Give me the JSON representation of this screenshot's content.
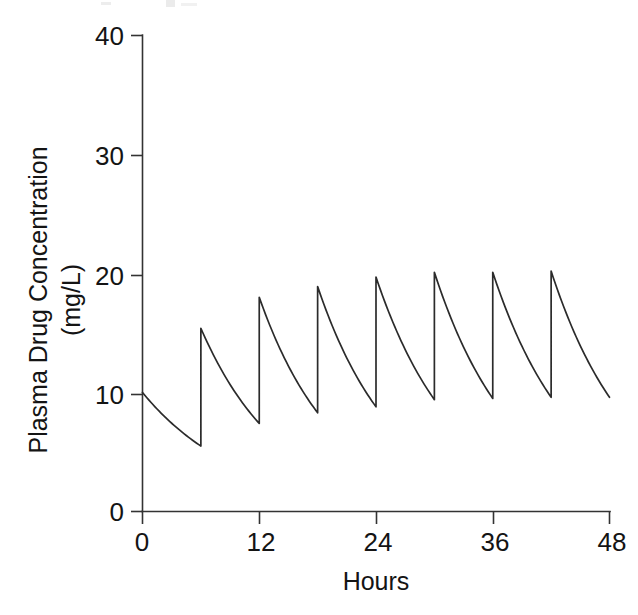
{
  "chart_data": {
    "type": "line",
    "title": "",
    "subtitle": "",
    "xlabel": "Hours",
    "ylabel": "Plasma Drug Concentration (mg/L)",
    "ylabel_line1": "Plasma Drug Concentration",
    "ylabel_line2": "(mg/L)",
    "xlim": [
      0,
      48
    ],
    "ylim": [
      0,
      40
    ],
    "xticks": [
      0,
      12,
      24,
      36,
      48
    ],
    "xtick_labels": [
      "0",
      "12",
      "24",
      "36",
      "48"
    ],
    "yticks": [
      0,
      10,
      20,
      30,
      40
    ],
    "ytick_labels": [
      "0",
      "10",
      "20",
      "30",
      "40"
    ],
    "grid": false,
    "legend": null,
    "legend_position": "none",
    "annotations": [],
    "dosing_interval_hours": 6,
    "number_of_doses": 8,
    "series": [
      {
        "name": "Plasma drug concentration",
        "color": "#2b2b2b",
        "x": [
          0,
          6,
          6,
          12,
          12,
          18,
          18,
          24,
          24,
          30,
          30,
          36,
          36,
          42,
          42,
          48
        ],
        "y": [
          10.0,
          5.5,
          15.4,
          7.4,
          18.0,
          8.3,
          18.9,
          8.8,
          19.7,
          9.4,
          20.1,
          9.5,
          20.1,
          9.6,
          20.2,
          9.6
        ],
        "peaks": [
          {
            "hour": 0,
            "value": 10.0
          },
          {
            "hour": 6,
            "value": 15.4
          },
          {
            "hour": 12,
            "value": 18.0
          },
          {
            "hour": 18,
            "value": 18.9
          },
          {
            "hour": 24,
            "value": 19.7
          },
          {
            "hour": 30,
            "value": 20.1
          },
          {
            "hour": 36,
            "value": 20.1
          },
          {
            "hour": 42,
            "value": 20.2
          }
        ],
        "troughs": [
          {
            "hour": 6,
            "value": 5.5
          },
          {
            "hour": 12,
            "value": 7.4
          },
          {
            "hour": 18,
            "value": 8.3
          },
          {
            "hour": 24,
            "value": 8.8
          },
          {
            "hour": 30,
            "value": 9.4
          },
          {
            "hour": 36,
            "value": 9.5
          },
          {
            "hour": 42,
            "value": 9.6
          },
          {
            "hour": 48,
            "value": 9.6
          }
        ]
      }
    ]
  },
  "figure": {
    "background_color": "#ffffff",
    "axis_color": "#333333",
    "text_color": "#141414",
    "curve_color": "#2b2b2b"
  }
}
